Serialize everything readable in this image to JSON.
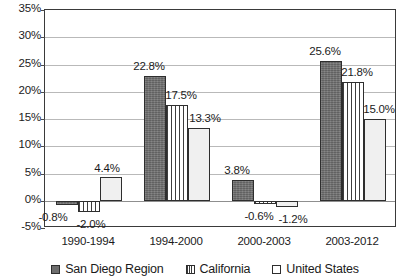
{
  "chart_data": {
    "type": "bar",
    "title": "",
    "xlabel": "",
    "ylabel": "",
    "categories": [
      "1990-1994",
      "1994-2000",
      "2000-2003",
      "2003-2012"
    ],
    "series": [
      {
        "name": "San Diego Region",
        "fill": "solid-dark-gray",
        "color": "#6e6e6e",
        "values": [
          -0.8,
          22.8,
          3.8,
          25.6
        ],
        "labels": [
          "-0.8%",
          "22.8%",
          "3.8%",
          "25.6%"
        ]
      },
      {
        "name": "California",
        "fill": "vertical-stripes",
        "color": "#ffffff",
        "values": [
          -2.0,
          17.5,
          -0.6,
          21.8
        ],
        "labels": [
          "-2.0%",
          "17.5%",
          "-0.6%",
          "21.8%"
        ]
      },
      {
        "name": "United States",
        "fill": "light-solid",
        "color": "#f0f0f0",
        "values": [
          4.4,
          13.3,
          -1.2,
          15.0
        ],
        "labels": [
          "4.4%",
          "13.3%",
          "-1.2%",
          "15.0%"
        ]
      }
    ],
    "ylim": [
      -5,
      35
    ],
    "ytick_step": 5,
    "ytick_labels": [
      "35%",
      "30%",
      "25%",
      "20%",
      "15%",
      "10%",
      "5%",
      "0%",
      "-5%"
    ],
    "ytick_values": [
      35,
      30,
      25,
      20,
      15,
      10,
      5,
      0,
      -5
    ],
    "grid": true,
    "legend_position": "bottom"
  },
  "legend": {
    "items": [
      {
        "label": "San Diego Region",
        "swatch": "san-diego-swatch"
      },
      {
        "label": "California",
        "swatch": "california-swatch"
      },
      {
        "label": "United States",
        "swatch": "united-states-swatch"
      }
    ]
  }
}
